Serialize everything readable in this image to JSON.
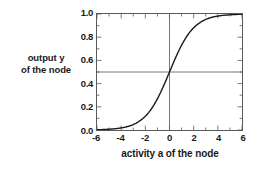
{
  "chart_data": {
    "type": "line",
    "title": "",
    "xlabel": "activity a of the node",
    "ylabel_lines": [
      "output y",
      "of the node"
    ],
    "ylabel": "output y of the node",
    "xlim": [
      -6,
      6
    ],
    "ylim": [
      0.0,
      1.0
    ],
    "grid": false,
    "legend": null,
    "xticks": [
      -6,
      -4,
      -2,
      0,
      2,
      4,
      6
    ],
    "xtick_labels": [
      "-6",
      "-4",
      "-2",
      "0",
      "2",
      "4",
      "6"
    ],
    "yticks": [
      0.0,
      0.2,
      0.4,
      0.6,
      0.8,
      1.0
    ],
    "ytick_labels": [
      "0.0",
      "0.2",
      "0.4",
      "0.6",
      "0.8",
      "1.0"
    ],
    "x_minor_ticks": [
      -5,
      -3,
      -1,
      1,
      3,
      5
    ],
    "y_minor_ticks": [
      0.1,
      0.3,
      0.5,
      0.7,
      0.9
    ],
    "reference_lines": [
      {
        "orientation": "vertical",
        "value": 0,
        "color": "#555555"
      },
      {
        "orientation": "horizontal",
        "value": 0.5,
        "color": "#555555"
      }
    ],
    "series": [
      {
        "name": "logistic sigmoid",
        "formula": "y = 1 / (1 + exp(-a))",
        "color": "#1a1a1a",
        "linewidth": 1.4,
        "x": [
          -6,
          -5.5,
          -5,
          -4.5,
          -4,
          -3.5,
          -3,
          -2.5,
          -2,
          -1.5,
          -1,
          -0.5,
          0,
          0.5,
          1,
          1.5,
          2,
          2.5,
          3,
          3.5,
          4,
          4.5,
          5,
          5.5,
          6
        ],
        "values": [
          0.002,
          0.004,
          0.007,
          0.011,
          0.018,
          0.029,
          0.047,
          0.076,
          0.119,
          0.182,
          0.269,
          0.378,
          0.5,
          0.622,
          0.731,
          0.818,
          0.881,
          0.924,
          0.953,
          0.971,
          0.982,
          0.989,
          0.993,
          0.996,
          0.998
        ]
      }
    ],
    "axis_color": "#5a5a5a",
    "background": "#ffffff"
  }
}
